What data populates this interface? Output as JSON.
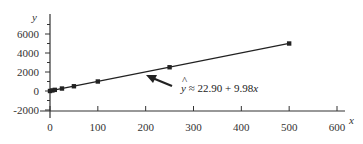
{
  "chart_data": {
    "type": "scatter",
    "title": "",
    "xlabel": "x",
    "ylabel": "y",
    "xlim": [
      0,
      650
    ],
    "ylim": [
      -2000,
      7500
    ],
    "x_ticks": [
      0,
      100,
      200,
      300,
      400,
      500,
      600
    ],
    "x_tick_labels": [
      "0",
      "100",
      "200",
      "300",
      "400",
      "500",
      "600"
    ],
    "y_ticks": [
      -2000,
      0,
      2000,
      4000,
      6000
    ],
    "y_tick_labels": [
      "-2000",
      "0",
      "2000",
      "4000",
      "6000"
    ],
    "grid": false,
    "legend": null,
    "series": [
      {
        "name": "data points",
        "type": "scatter",
        "marker": "square",
        "x": [
          0,
          5,
          10,
          25,
          50,
          100,
          250,
          500
        ],
        "y": [
          0,
          60,
          120,
          260,
          500,
          1000,
          2500,
          5000
        ]
      },
      {
        "name": "fitted line",
        "type": "line",
        "intercept": 22.9,
        "slope": 9.98,
        "x": [
          0,
          500
        ],
        "y": [
          22.9,
          5012.9
        ]
      }
    ],
    "annotations": [
      {
        "text": "ŷ ≈ 22.90 + 9.98x",
        "arrow_to": [
          200,
          2019
        ]
      }
    ]
  },
  "labels": {
    "x_axis": "x",
    "y_axis": "y",
    "equation_hat": "^",
    "equation_y": "y",
    "equation_rest": " ≈ 22.90 + 9.98",
    "equation_x": "x"
  }
}
